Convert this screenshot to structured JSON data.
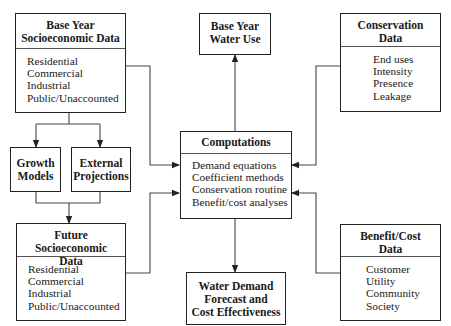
{
  "diagram": {
    "nodes": {
      "base_socio": {
        "title_line1": "Base Year",
        "title_line2": "Socioeconomic Data",
        "items": [
          "Residential",
          "Commercial",
          "Industrial",
          "Public/Unaccounted"
        ]
      },
      "growth_models": {
        "title_line1": "Growth",
        "title_line2": "Models"
      },
      "external_projections": {
        "title_line1": "External",
        "title_line2": "Projections"
      },
      "future_socio": {
        "title_line1": "Future Socioeconomic",
        "title_line2": "Data",
        "items": [
          "Residential",
          "Commercial",
          "Industrial",
          "Public/Unaccounted"
        ]
      },
      "base_water_use": {
        "title_line1": "Base Year",
        "title_line2": "Water Use"
      },
      "computations": {
        "title": "Computations",
        "items": [
          "Demand equations",
          "Coefficient methods",
          "Conservation routine",
          "Benefit/cost analyses"
        ]
      },
      "forecast": {
        "title_line1": "Water Demand",
        "title_line2": "Forecast and",
        "title_line3": "Cost Effectiveness"
      },
      "conservation": {
        "title_line1": "Conservation",
        "title_line2": "Data",
        "items": [
          "End uses",
          "Intensity",
          "Presence",
          "Leakage"
        ]
      },
      "benefit_cost": {
        "title_line1": "Benefit/Cost",
        "title_line2": "Data",
        "items": [
          "Customer",
          "Utility",
          "Community",
          "Society"
        ]
      }
    },
    "edges": [
      {
        "from": "Base Year Socioeconomic Data",
        "to": "Growth Models"
      },
      {
        "from": "Base Year Socioeconomic Data",
        "to": "External Projections"
      },
      {
        "from": "Growth Models",
        "to": "Future Socioeconomic Data"
      },
      {
        "from": "External Projections",
        "to": "Future Socioeconomic Data"
      },
      {
        "from": "Base Year Socioeconomic Data",
        "to": "Computations"
      },
      {
        "from": "Future Socioeconomic Data",
        "to": "Computations"
      },
      {
        "from": "Conservation Data",
        "to": "Computations"
      },
      {
        "from": "Benefit/Cost Data",
        "to": "Computations"
      },
      {
        "from": "Computations",
        "to": "Base Year Water Use"
      },
      {
        "from": "Computations",
        "to": "Water Demand Forecast and Cost Effectiveness"
      }
    ]
  }
}
